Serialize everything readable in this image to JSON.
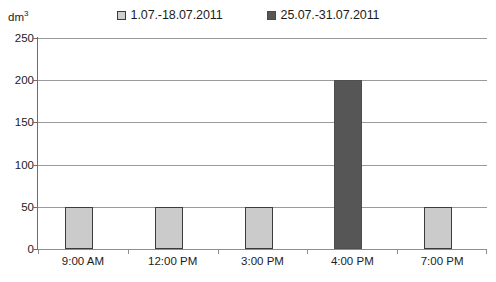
{
  "chart_data": {
    "type": "bar",
    "title": "",
    "subtitle": "",
    "xlabel": "",
    "ylabel": "dm3",
    "ylabel_display": "dm",
    "ylabel_superscript": "3",
    "categories": [
      "9:00 AM",
      "12:00 PM",
      "3:00 PM",
      "4:00 PM",
      "7:00 PM"
    ],
    "series": [
      {
        "name": "1.07.-18.07.2011",
        "color": "#cbcbcb",
        "border_color": "#3c3c3c",
        "values": [
          50,
          50,
          50,
          null,
          50
        ]
      },
      {
        "name": "25.07.-31.07.2011",
        "color": "#565656",
        "border_color": "#4e4e4e",
        "values": [
          null,
          null,
          null,
          200,
          null
        ]
      }
    ],
    "ylim": [
      0,
      250
    ],
    "yticks": [
      0,
      50,
      100,
      150,
      200,
      250
    ],
    "ytick_labels": [
      "0",
      "50",
      "100",
      "150",
      "200",
      "250"
    ],
    "grid": true,
    "grid_axis": "y",
    "grid_color": "#9a9a9a",
    "legend_position": "top-center"
  },
  "legend": {
    "entries": [
      {
        "label": "1.07.-18.07.2011",
        "swatch": "light"
      },
      {
        "label": "25.07.-31.07.2011",
        "swatch": "dark"
      }
    ]
  }
}
